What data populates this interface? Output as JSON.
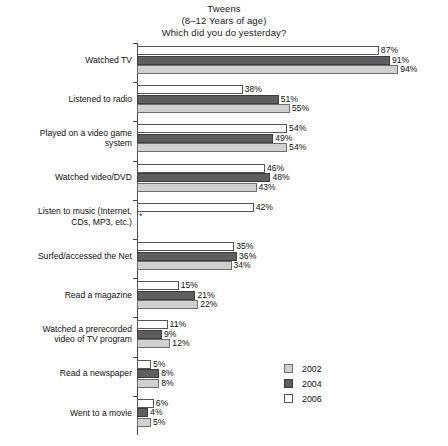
{
  "chart_data": {
    "type": "bar",
    "orientation": "horizontal",
    "title": "Tweens",
    "subtitle": "(8–12 Years of age)",
    "subtitle2": "Which did you do yesterday?",
    "title_lines": [
      "Tweens",
      "(8–12 Years of age)",
      "Which did you do yesterday?"
    ],
    "xlabel": "",
    "ylabel": "",
    "xlim": [
      0,
      100
    ],
    "grid": false,
    "legend_position": "bottom-right",
    "value_suffix": "%",
    "categories": [
      "Watched TV",
      "Listened to radio",
      "Played on a video game\nsystem",
      "Watched video/DVD",
      "Listen to music (Internet,\nCDs, MP3, etc.)",
      "Surfed/accessed the Net",
      "Read a magazine",
      "Watched a prerecorded\nvideo of TV program",
      "Read a newspaper",
      "Went to a movie"
    ],
    "series": [
      {
        "name": "2006",
        "color": "#ffffff",
        "values": [
          87,
          38,
          54,
          46,
          42,
          35,
          15,
          11,
          5,
          6
        ],
        "labels": [
          "87%",
          "38%",
          "54%",
          "46%",
          "42%",
          "35%",
          "15%",
          "11%",
          "5%",
          "6%"
        ]
      },
      {
        "name": "2004",
        "color": "#5e5e5e",
        "values": [
          91,
          51,
          49,
          48,
          null,
          36,
          21,
          9,
          8,
          4
        ],
        "labels": [
          "91%",
          "51%",
          "49%",
          "48%",
          "*",
          "36%",
          "21%",
          "9%",
          "8%",
          "4%"
        ]
      },
      {
        "name": "2002",
        "color": "#d0d0d0",
        "values": [
          94,
          55,
          54,
          43,
          null,
          34,
          22,
          12,
          8,
          5
        ],
        "labels": [
          "94%",
          "55%",
          "54%",
          "43%",
          "",
          "34%",
          "22%",
          "12%",
          "8%",
          "5%"
        ]
      }
    ]
  },
  "legend": {
    "items": [
      {
        "label": "2002",
        "swatch": "y2002"
      },
      {
        "label": "2004",
        "swatch": "y2004"
      },
      {
        "label": "2006",
        "swatch": "y2006"
      }
    ]
  }
}
